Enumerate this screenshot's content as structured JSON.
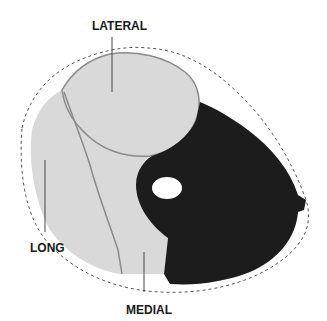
{
  "diagram": {
    "type": "anatomical-cross-section",
    "labels": {
      "lateral": "LATERAL",
      "long": "LONG",
      "medial": "MEDIAL"
    },
    "colors": {
      "background": "#ffffff",
      "muscle_light": "#d9d9d9",
      "muscle_dark": "#1c1c1c",
      "border": "#8a8a8a",
      "outline_dashed": "#555555",
      "label_text": "#1a1a1a",
      "bone_hole": "#ffffff"
    }
  }
}
